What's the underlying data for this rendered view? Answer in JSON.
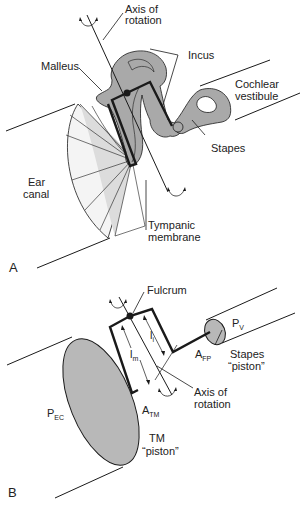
{
  "panel_a": {
    "letter": "A",
    "labels": {
      "axis_of_rotation_1": "Axis of",
      "axis_of_rotation_2": "rotation",
      "incus": "Incus",
      "malleus": "Malleus",
      "cochlear_1": "Cochlear",
      "cochlear_2": "vestibule",
      "stapes": "Stapes",
      "ear_canal_1": "Ear",
      "ear_canal_2": "canal",
      "tympanic_1": "Tympanic",
      "tympanic_2": "membrane"
    }
  },
  "panel_b": {
    "letter": "B",
    "labels": {
      "fulcrum": "Fulcrum",
      "pv_main": "P",
      "pv_sub": "V",
      "afp_main": "A",
      "afp_sub": "FP",
      "stapes_piston_1": "Stapes",
      "stapes_piston_2": "“piston”",
      "lm_main": "l",
      "lm_sub": "m",
      "li_main": "l",
      "li_sub": "i",
      "axis_1": "Axis of",
      "axis_2": "rotation",
      "pec_main": "P",
      "pec_sub": "EC",
      "atm_main": "A",
      "atm_sub": "TM",
      "tm_piston_1": "TM",
      "tm_piston_2": "“piston”"
    }
  },
  "colors": {
    "bone_fill": "#a9a9a9",
    "membrane_fill": "#dcdcdc",
    "piston_fill": "#b8b8b8",
    "line": "#1a1a1a"
  }
}
